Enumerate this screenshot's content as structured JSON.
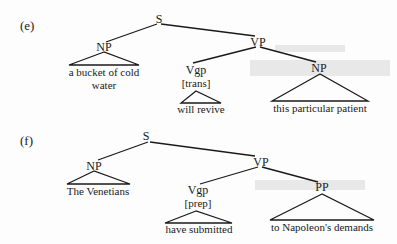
{
  "trees": [
    {
      "label": "(e)",
      "root": "S",
      "np": {
        "label": "NP",
        "text_lines": [
          "a bucket of cold",
          "water"
        ]
      },
      "vp": {
        "label": "VP",
        "vgp": {
          "label": "Vgp",
          "feature": "[trans]",
          "text": "will revive"
        },
        "complement": {
          "label": "NP",
          "text": "this particular patient"
        }
      }
    },
    {
      "label": "(f)",
      "root": "S",
      "np": {
        "label": "NP",
        "text_lines": [
          "The Venetians"
        ]
      },
      "vp": {
        "label": "VP",
        "vgp": {
          "label": "Vgp",
          "feature": "[prep]",
          "text": "have submitted"
        },
        "complement": {
          "label": "PP",
          "text": "to Napoleon's demands"
        }
      }
    }
  ]
}
